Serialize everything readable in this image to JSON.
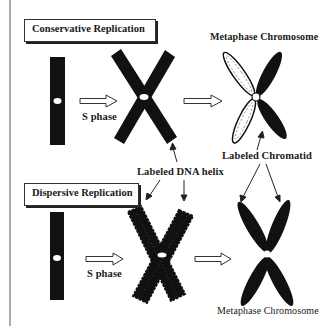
{
  "diagram": {
    "panels": [
      {
        "title": "Conservative Replication",
        "step_label": "S phase",
        "result_label": "Metaphase Chromosome",
        "result_annotation": "Labeled Chromatid"
      },
      {
        "title": "Dispersive Replication",
        "step_label": "S phase",
        "result_label": "Metaphase Chromosome"
      }
    ],
    "shared_annotation": "Labeled DNA helix",
    "colors": {
      "chromosome": "#111111",
      "background": "#ffffff",
      "border": "#444444"
    }
  }
}
